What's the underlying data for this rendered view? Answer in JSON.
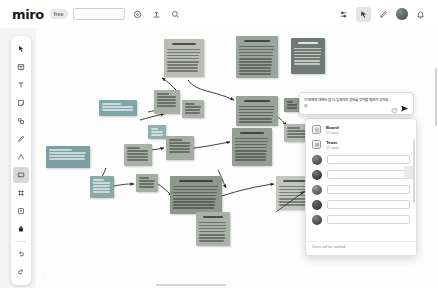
{
  "app": {
    "name": "miro",
    "plan_badge": "free",
    "board_name_value": "",
    "board_name_placeholder": ""
  },
  "topbar": {
    "left_icons": [
      {
        "name": "settings-icon",
        "glyph": "gear"
      },
      {
        "name": "upload-icon",
        "glyph": "upload"
      },
      {
        "name": "search-icon",
        "glyph": "search"
      }
    ],
    "right_icons": [
      {
        "name": "frames-icon",
        "glyph": "frames"
      },
      {
        "name": "cursor-icon",
        "glyph": "cursor"
      },
      {
        "name": "comment-pen-icon",
        "glyph": "pen"
      },
      {
        "name": "user-avatar",
        "glyph": "avatar"
      },
      {
        "name": "notifications-icon",
        "glyph": "bell"
      }
    ]
  },
  "left_toolbar": {
    "tools": [
      {
        "name": "select-tool",
        "label": "Select"
      },
      {
        "name": "templates-tool",
        "label": "Templates"
      },
      {
        "name": "text-tool",
        "label": "Text"
      },
      {
        "name": "sticky-note-tool",
        "label": "Sticky note"
      },
      {
        "name": "shapes-tool",
        "label": "Shapes"
      },
      {
        "name": "pen-tool",
        "label": "Pen"
      },
      {
        "name": "connection-line-tool",
        "label": "Connection line"
      },
      {
        "name": "comment-tool",
        "label": "Comment"
      },
      {
        "name": "frame-tool",
        "label": "Frame"
      },
      {
        "name": "upload-tool",
        "label": "Upload"
      },
      {
        "name": "more-apps-tool",
        "label": "More apps"
      },
      {
        "name": "undo-tool",
        "label": "Undo"
      },
      {
        "name": "redo-tool",
        "label": "Redo"
      }
    ],
    "selected_index": 7
  },
  "mention_composer": {
    "message": "이 문제에 대해서 좀 더 입체적인 정보를 찾아볼 필요가 있어요 @",
    "emoji_icon": "emoji-icon",
    "send_icon": "send-icon"
  },
  "mention_dropdown": {
    "groups": [
      {
        "name": "Board",
        "subtitle": "11 users",
        "icon": "board-icon"
      },
      {
        "name": "Team",
        "subtitle": "17 users",
        "icon": "team-icon"
      }
    ],
    "people_rows": 5,
    "footer_note": "Users will be notified."
  },
  "canvas": {
    "notes": [
      {
        "id": "n1",
        "x": 128,
        "y": 11,
        "w": 40,
        "h": 38,
        "color": "#b9bdb5",
        "dark": false,
        "lines": 9,
        "title": true
      },
      {
        "id": "n2",
        "x": 200,
        "y": 8,
        "w": 42,
        "h": 42,
        "color": "#9aa49c",
        "dark": false,
        "lines": 11,
        "title": true
      },
      {
        "id": "n3",
        "x": 255,
        "y": 10,
        "w": 34,
        "h": 36,
        "color": "#6f7a74",
        "dark": true,
        "lines": 7,
        "title": true
      },
      {
        "id": "n4",
        "x": 118,
        "y": 62,
        "w": 26,
        "h": 24,
        "color": "#a8b0a8",
        "dark": false,
        "lines": 5,
        "title": false
      },
      {
        "id": "n5",
        "x": 63,
        "y": 72,
        "w": 38,
        "h": 16,
        "color": "#7fa6a8",
        "dark": true,
        "lines": 3,
        "title": false
      },
      {
        "id": "n6",
        "x": 112,
        "y": 97,
        "w": 18,
        "h": 14,
        "color": "#8fb0ae",
        "dark": true,
        "lines": 3,
        "title": false
      },
      {
        "id": "n7",
        "x": 146,
        "y": 72,
        "w": 22,
        "h": 18,
        "color": "#aab2aa",
        "dark": false,
        "lines": 4,
        "title": false
      },
      {
        "id": "n8",
        "x": 200,
        "y": 68,
        "w": 42,
        "h": 30,
        "color": "#9aa29a",
        "dark": false,
        "lines": 7,
        "title": true
      },
      {
        "id": "n9",
        "x": 248,
        "y": 70,
        "w": 16,
        "h": 14,
        "color": "#8e968e",
        "dark": false,
        "lines": 3,
        "title": false
      },
      {
        "id": "n10",
        "x": 10,
        "y": 118,
        "w": 44,
        "h": 22,
        "color": "#7c9fa6",
        "dark": true,
        "lines": 4,
        "title": false
      },
      {
        "id": "n11",
        "x": 88,
        "y": 116,
        "w": 28,
        "h": 22,
        "color": "#a9b1a9",
        "dark": false,
        "lines": 5,
        "title": false
      },
      {
        "id": "n12",
        "x": 130,
        "y": 108,
        "w": 28,
        "h": 24,
        "color": "#a4aca4",
        "dark": false,
        "lines": 5,
        "title": false
      },
      {
        "id": "n13",
        "x": 196,
        "y": 100,
        "w": 40,
        "h": 38,
        "color": "#959d95",
        "dark": false,
        "lines": 9,
        "title": true
      },
      {
        "id": "n14",
        "x": 54,
        "y": 148,
        "w": 24,
        "h": 22,
        "color": "#8aa8a6",
        "dark": true,
        "lines": 5,
        "title": false
      },
      {
        "id": "n15",
        "x": 100,
        "y": 146,
        "w": 22,
        "h": 18,
        "color": "#a5ada5",
        "dark": false,
        "lines": 4,
        "title": false
      },
      {
        "id": "n16",
        "x": 134,
        "y": 148,
        "w": 52,
        "h": 38,
        "color": "#8e968e",
        "dark": false,
        "lines": 9,
        "title": true
      },
      {
        "id": "n17",
        "x": 240,
        "y": 148,
        "w": 38,
        "h": 34,
        "color": "#c2c6bf",
        "dark": false,
        "lines": 8,
        "title": true
      },
      {
        "id": "n18",
        "x": 160,
        "y": 184,
        "w": 34,
        "h": 34,
        "color": "#a9b1a9",
        "dark": false,
        "lines": 8,
        "title": true
      },
      {
        "id": "n19",
        "x": 248,
        "y": 96,
        "w": 28,
        "h": 18,
        "color": "#b5bab3",
        "dark": false,
        "lines": 4,
        "title": false
      }
    ],
    "connections": [
      "M 152 52 C 160 64, 176 62, 198 72",
      "M 140 62 C 134 56, 132 54, 126 50",
      "M 112 84 C 122 82, 126 80, 144 78",
      "M 104 92 C 112 90, 118 88, 128 86",
      "M 100 124 C 112 122, 118 122, 128 120",
      "M 158 120 C 174 118, 182 116, 194 114",
      "M 70 140 C 66 150, 64 152, 64 150",
      "M 78 158 C 88 156, 92 156, 98 156",
      "M 122 156 C 128 160, 132 164, 136 168",
      "M 186 168 C 204 162, 222 158, 238 156",
      "M 182 142 C 186 150, 188 156, 190 160",
      "M 240 88 C 246 92, 248 94, 250 98",
      "M 276 110 C 288 118, 292 124, 296 132"
    ]
  }
}
